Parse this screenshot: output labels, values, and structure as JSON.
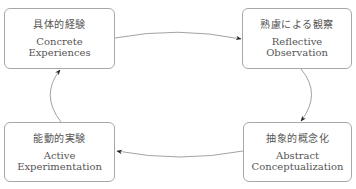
{
  "diagram": {
    "type": "cycle",
    "nodes": [
      {
        "id": "box-1",
        "jp": "具体的経験",
        "en_line1": "Concrete",
        "en_line2": "Experiences"
      },
      {
        "id": "box-2",
        "jp": "熟慮による観察",
        "en_line1": "Reflective",
        "en_line2": "Observation"
      },
      {
        "id": "box-3",
        "jp": "抽象的概念化",
        "en_line1": "Abstract",
        "en_line2": "Conceptualization"
      },
      {
        "id": "box-4",
        "jp": "能動的実験",
        "en_line1": "Active",
        "en_line2": "Experimentation"
      }
    ],
    "edges": [
      {
        "from": "box-1",
        "to": "box-2"
      },
      {
        "from": "box-2",
        "to": "box-3"
      },
      {
        "from": "box-3",
        "to": "box-4"
      },
      {
        "from": "box-4",
        "to": "box-1"
      }
    ],
    "colors": {
      "border": "#a8a8a8",
      "arrow": "#888888",
      "arrowhead": "#222222",
      "text": "#555555"
    }
  }
}
